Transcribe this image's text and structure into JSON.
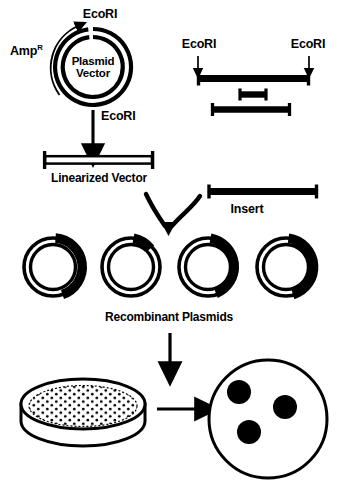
{
  "figure": {
    "background_color": "#ffffff",
    "ink_color": "#000000",
    "width": 338,
    "height": 485
  },
  "labels": {
    "plasmid_ecori_top": "EcoRI",
    "amp_resistance": "Amp",
    "amp_resistance_superscript": "R",
    "plasmid_vector_line1": "Plasmid",
    "plasmid_vector_line2": "Vector",
    "digest_ecori": "EcoRI",
    "linearized_vector": "Linearized Vector",
    "genomic_ecori_left": "EcoRI",
    "genomic_ecori_right": "EcoRI",
    "insert": "Insert",
    "recombinant_plasmids": "Recombinant Plasmids"
  },
  "plasmid_vector": {
    "name": "Plasmid Vector",
    "center_x": 93,
    "center_y": 67,
    "outer_radius": 38,
    "inner_radius": 30,
    "ecori_gap_degrees": 14,
    "amp_arrow": "counterclockwise-arc-arrow"
  },
  "genomic_dna": {
    "description": "Genomic DNA with two EcoRI sites and resulting fragments",
    "fragments": [
      {
        "name": "full-length-genomic-dna",
        "x1": 198,
        "x2": 309,
        "y": 78,
        "style": "solid"
      },
      {
        "name": "small-middle-fragment",
        "x1": 239,
        "x2": 267,
        "y": 94,
        "style": "solid"
      },
      {
        "name": "lower-left-fragment",
        "x1": 212,
        "x2": 290,
        "y": 109,
        "style": "solid"
      }
    ],
    "ecori_arrow_x_left": 198,
    "ecori_arrow_x_right": 309
  },
  "linearized_vector": {
    "name": "linearized-vector-bar",
    "x1": 42,
    "x2": 155,
    "y": 160,
    "style": "hollow"
  },
  "insert_fragment": {
    "name": "insert-bar",
    "x1": 208,
    "x2": 318,
    "y": 191,
    "style": "solid"
  },
  "recombinant_plasmids": {
    "count": 4,
    "items": [
      {
        "name": "recombinant-plasmid-1",
        "cx": 53,
        "cy": 267,
        "r_outer": 32,
        "insert_arc_start": -82,
        "insert_arc_end": 72,
        "thick": true
      },
      {
        "name": "recombinant-plasmid-2",
        "cx": 131,
        "cy": 267,
        "r_outer": 32,
        "insert_arc_start": -82,
        "insert_arc_end": -48,
        "thick": true
      },
      {
        "name": "recombinant-plasmid-3",
        "cx": 208,
        "cy": 267,
        "r_outer": 32,
        "insert_arc_start": -82,
        "insert_arc_end": 66,
        "thick": true
      },
      {
        "name": "recombinant-plasmid-4",
        "cx": 286,
        "cy": 267,
        "r_outer": 32,
        "insert_arc_start": -82,
        "insert_arc_end": 76,
        "thick": true
      }
    ]
  },
  "transformation": {
    "bacteria_dish": {
      "name": "bacterial-lawn-petri-dish",
      "center_x": 83,
      "center_y": 405,
      "rx": 62,
      "ry": 25,
      "depth": 36,
      "dot_count": 120
    },
    "colony_plate": {
      "name": "colony-plate",
      "center_x": 268,
      "center_y": 419,
      "radius": 59,
      "colonies": [
        {
          "cx": 239,
          "cy": 392,
          "r": 12
        },
        {
          "cx": 285,
          "cy": 407,
          "r": 12
        },
        {
          "cx": 249,
          "cy": 432,
          "r": 12
        }
      ]
    }
  },
  "arrows": [
    {
      "name": "ecori-digest-arrow",
      "type": "straight-down",
      "x": 93,
      "y1": 110,
      "y2": 150
    },
    {
      "name": "ecori-site-arrow-left",
      "type": "straight-down-small",
      "x": 198,
      "y1": 55,
      "y2": 70
    },
    {
      "name": "ecori-site-arrow-right",
      "type": "straight-down-small",
      "x": 309,
      "y1": 55,
      "y2": 70
    },
    {
      "name": "ligation-arrow-left",
      "type": "curved-converging",
      "from": "linearized-vector",
      "to": "recombinant-plasmids"
    },
    {
      "name": "ligation-arrow-right",
      "type": "curved-converging",
      "from": "insert",
      "to": "recombinant-plasmids"
    },
    {
      "name": "transformation-arrow",
      "type": "straight-down",
      "x": 170,
      "y1": 332,
      "y2": 368
    },
    {
      "name": "plating-arrow",
      "type": "straight-right",
      "x1": 158,
      "x2": 202,
      "y": 409
    }
  ]
}
